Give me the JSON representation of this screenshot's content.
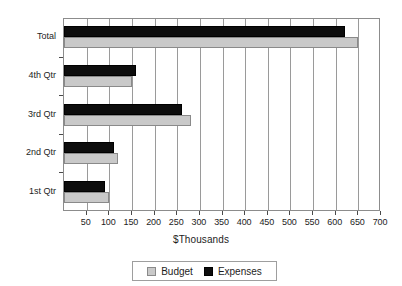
{
  "chart_data": {
    "type": "bar",
    "orientation": "horizontal",
    "title": "",
    "subtitle": "",
    "xlabel": "$Thousands",
    "ylabel": "",
    "categories": [
      "Total",
      "4th Qtr",
      "3rd Qtr",
      "2nd Qtr",
      "1st Qtr"
    ],
    "series": [
      {
        "name": "Budget",
        "color": "#c9c9c9",
        "values": [
          650,
          150,
          280,
          120,
          100
        ]
      },
      {
        "name": "Expenses",
        "color": "#0d0d0d",
        "values": [
          620,
          160,
          260,
          110,
          90
        ]
      }
    ],
    "xlim": [
      0,
      700
    ],
    "xticks": [
      50,
      100,
      150,
      200,
      250,
      300,
      350,
      400,
      450,
      500,
      550,
      600,
      650,
      700
    ],
    "xticklabels": [
      "50",
      "100",
      "150",
      "200",
      "250",
      "300",
      "350",
      "400",
      "450",
      "500",
      "550",
      "600",
      "650",
      "700"
    ],
    "grid": "vertical",
    "legend_position": "bottom",
    "legend_entries": [
      "Budget",
      "Expenses"
    ]
  },
  "axis": {
    "x_title": "$Thousands"
  },
  "legend": {
    "budget_label": "Budget",
    "expenses_label": "Expenses"
  }
}
